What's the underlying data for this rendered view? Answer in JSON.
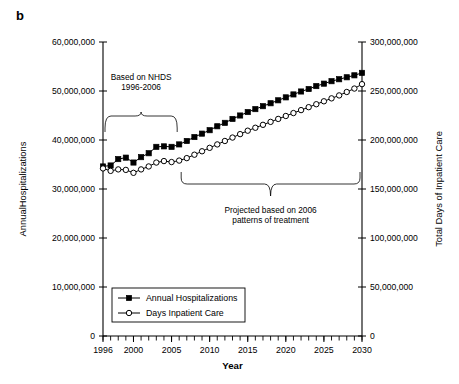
{
  "figure": {
    "panel_label": "b"
  },
  "chart_data": {
    "type": "line",
    "title": "",
    "xlabel": "Year",
    "ylabel": "AnnualHospitalizations",
    "y2label": "Total Days of Inpatient Care",
    "grid": false,
    "legend_position": "bottom-left-inside",
    "xlim": [
      1996,
      2030
    ],
    "ylim": [
      0,
      60000000
    ],
    "y2lim": [
      0,
      300000000
    ],
    "x": [
      1996,
      1997,
      1998,
      1999,
      2000,
      2001,
      2002,
      2003,
      2004,
      2005,
      2006,
      2007,
      2008,
      2009,
      2010,
      2011,
      2012,
      2013,
      2014,
      2015,
      2016,
      2017,
      2018,
      2019,
      2020,
      2021,
      2022,
      2023,
      2024,
      2025,
      2026,
      2027,
      2028,
      2029,
      2030
    ],
    "xticklabels": [
      "1996",
      "2000",
      "2005",
      "2010",
      "2015",
      "2020",
      "2025",
      "2030"
    ],
    "xtickvalues": [
      1996,
      2000,
      2005,
      2010,
      2015,
      2020,
      2025,
      2030
    ],
    "yticklabels": [
      "0",
      "10,000,000",
      "20,000,000",
      "30,000,000",
      "40,000,000",
      "50,000,000",
      "60,000,000"
    ],
    "ytickvalues": [
      0,
      10000000,
      20000000,
      30000000,
      40000000,
      50000000,
      60000000
    ],
    "y2ticklabels": [
      "0",
      "50,000,000",
      "100,000,000",
      "150,000,000",
      "200,000,000",
      "250,000,000",
      "300,000,000"
    ],
    "y2tickvalues": [
      0,
      50000000,
      100000000,
      150000000,
      200000000,
      250000000,
      300000000
    ],
    "series": [
      {
        "name": "Annual Hospitalizations",
        "axis": "left",
        "marker": "filled-square",
        "values": [
          34600000,
          34800000,
          36100000,
          36400000,
          35400000,
          36500000,
          37300000,
          38600000,
          38700000,
          38600000,
          39100000,
          39800000,
          40600000,
          41300000,
          42000000,
          42800000,
          43500000,
          44300000,
          45000000,
          45700000,
          46300000,
          46900000,
          47500000,
          48100000,
          48700000,
          49300000,
          49900000,
          50400000,
          51000000,
          51500000,
          52000000,
          52400000,
          52800000,
          53200000,
          53700000
        ]
      },
      {
        "name": "Days Inpatient Care",
        "axis": "right",
        "marker": "open-circle",
        "values": [
          171000000,
          168500000,
          170000000,
          169500000,
          166500000,
          170000000,
          173000000,
          177000000,
          178500000,
          177500000,
          179000000,
          181500000,
          185000000,
          188500000,
          192000000,
          195500000,
          199000000,
          202500000,
          206000000,
          209500000,
          212500000,
          215500000,
          218500000,
          221500000,
          224500000,
          227500000,
          230500000,
          233500000,
          236500000,
          239500000,
          242500000,
          245500000,
          249000000,
          252500000,
          257000000
        ]
      }
    ],
    "annotations": [
      {
        "id": "nhds-annotation",
        "text_lines": [
          "Based on NHDS",
          "1996-2006"
        ],
        "brace_span_years": [
          1996,
          2006
        ],
        "brace_position": "above-data"
      },
      {
        "id": "projection-annotation",
        "text_lines": [
          "Projected based on 2006",
          "patterns of treatment"
        ],
        "brace_span_years": [
          2006,
          2030
        ],
        "brace_position": "below-data"
      }
    ]
  },
  "colors": {
    "axis": "#000000",
    "series_filled": "#000000",
    "series_open": "#ffffff",
    "background": "#ffffff"
  }
}
